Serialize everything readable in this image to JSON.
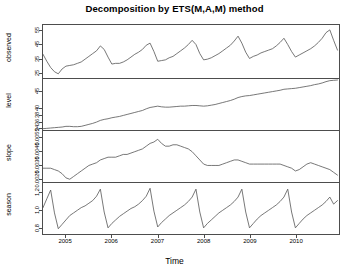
{
  "chart_data": {
    "type": "line",
    "title": "Decomposition by ETS(M,A,M) method",
    "xlabel": "Time",
    "ylabel": "",
    "grid": false,
    "legend": "none",
    "xlim": [
      2004.5,
      2010.95
    ],
    "x_ticks": [
      "2005",
      "2006",
      "2007",
      "2008",
      "2009",
      "2010"
    ],
    "x_tick_values": [
      2005,
      2006,
      2007,
      2008,
      2009,
      2010
    ],
    "x": [
      2004.5,
      2004.583,
      2004.667,
      2004.75,
      2004.833,
      2004.917,
      2005.0,
      2005.083,
      2005.167,
      2005.25,
      2005.333,
      2005.417,
      2005.5,
      2005.583,
      2005.667,
      2005.75,
      2005.833,
      2005.917,
      2006.0,
      2006.083,
      2006.167,
      2006.25,
      2006.333,
      2006.417,
      2006.5,
      2006.583,
      2006.667,
      2006.75,
      2006.833,
      2006.917,
      2007.0,
      2007.083,
      2007.167,
      2007.25,
      2007.333,
      2007.417,
      2007.5,
      2007.583,
      2007.667,
      2007.75,
      2007.833,
      2007.917,
      2008.0,
      2008.083,
      2008.167,
      2008.25,
      2008.333,
      2008.417,
      2008.5,
      2008.583,
      2008.667,
      2008.75,
      2008.833,
      2008.917,
      2009.0,
      2009.083,
      2009.167,
      2009.25,
      2009.333,
      2009.417,
      2009.5,
      2009.583,
      2009.667,
      2009.75,
      2009.833,
      2009.917,
      2010.0,
      2010.083,
      2010.167,
      2010.25,
      2010.333,
      2010.417,
      2010.5,
      2010.583,
      2010.667,
      2010.75,
      2010.833,
      2010.917
    ],
    "panels": [
      {
        "name": "observed",
        "label": "observed",
        "ylim": [
          21,
          59
        ],
        "y_ticks": [
          "25",
          "35",
          "45",
          "55"
        ],
        "y_tick_values": [
          25,
          35,
          45,
          55
        ],
        "values": [
          38.0,
          33.0,
          28.5,
          25.5,
          24.0,
          27.5,
          29.5,
          30.0,
          30.5,
          31.5,
          32.5,
          34.5,
          36.5,
          38.5,
          40.5,
          44.0,
          41.5,
          36.0,
          31.0,
          31.5,
          31.5,
          32.5,
          34.0,
          36.0,
          38.0,
          39.5,
          41.5,
          44.5,
          46.0,
          40.0,
          33.0,
          33.5,
          34.0,
          35.5,
          36.5,
          38.5,
          40.5,
          42.5,
          45.0,
          48.0,
          45.0,
          38.5,
          34.0,
          34.5,
          35.5,
          37.0,
          38.5,
          40.5,
          42.5,
          44.5,
          47.5,
          51.0,
          46.0,
          39.5,
          35.0,
          36.5,
          37.5,
          39.0,
          40.0,
          41.0,
          42.0,
          44.0,
          46.5,
          49.5,
          45.0,
          40.0,
          36.0,
          37.5,
          39.0,
          40.5,
          42.0,
          44.0,
          46.5,
          49.5,
          53.5,
          55.5,
          48.0,
          41.0
        ]
      },
      {
        "name": "level",
        "label": "level",
        "ylim": [
          33.2,
          48.6
        ],
        "y_ticks": [
          "34",
          "36",
          "38",
          "40",
          "45"
        ],
        "y_tick_values": [
          34,
          36,
          38,
          40,
          45
        ],
        "values": [
          33.6,
          33.7,
          33.8,
          33.9,
          34.0,
          34.1,
          34.3,
          34.3,
          34.2,
          34.2,
          34.3,
          34.6,
          34.9,
          35.2,
          35.6,
          36.1,
          36.4,
          36.6,
          36.9,
          37.1,
          37.3,
          37.6,
          37.9,
          38.2,
          38.5,
          38.8,
          39.1,
          39.6,
          40.0,
          40.2,
          40.4,
          40.2,
          40.1,
          40.1,
          40.2,
          40.3,
          40.4,
          40.4,
          40.5,
          40.6,
          40.6,
          40.5,
          40.4,
          40.5,
          40.7,
          40.9,
          41.2,
          41.5,
          41.8,
          42.1,
          42.5,
          43.0,
          43.3,
          43.5,
          43.6,
          43.8,
          44.0,
          44.2,
          44.4,
          44.6,
          44.8,
          45.0,
          45.2,
          45.5,
          45.6,
          45.7,
          45.8,
          46.0,
          46.2,
          46.4,
          46.6,
          46.9,
          47.1,
          47.4,
          47.8,
          48.1,
          48.2,
          48.3
        ]
      },
      {
        "name": "slope",
        "label": "slope",
        "ylim": [
          0.0022,
          0.0059
        ],
        "y_ticks": [
          "0.0025",
          "0.0035",
          "0.0045",
          "0.0055"
        ],
        "y_tick_values": [
          0.0025,
          0.0035,
          0.0045,
          0.0055
        ],
        "values": [
          0.0032,
          0.0032,
          0.0032,
          0.0031,
          0.003,
          0.0028,
          0.0025,
          0.0024,
          0.0026,
          0.0028,
          0.003,
          0.0032,
          0.0034,
          0.0035,
          0.0036,
          0.0038,
          0.0039,
          0.004,
          0.004,
          0.004,
          0.0041,
          0.0042,
          0.0042,
          0.0043,
          0.0044,
          0.0045,
          0.0046,
          0.0048,
          0.005,
          0.0051,
          0.0053,
          0.005,
          0.0048,
          0.0048,
          0.0049,
          0.0049,
          0.0048,
          0.0047,
          0.0046,
          0.0044,
          0.0041,
          0.0038,
          0.0035,
          0.0034,
          0.0034,
          0.0034,
          0.0034,
          0.0035,
          0.0036,
          0.0037,
          0.0038,
          0.0038,
          0.0037,
          0.0036,
          0.0035,
          0.0035,
          0.0035,
          0.0035,
          0.0035,
          0.0035,
          0.0035,
          0.0035,
          0.0035,
          0.0034,
          0.0033,
          0.0032,
          0.003,
          0.0031,
          0.0033,
          0.0035,
          0.0036,
          0.0035,
          0.0034,
          0.0033,
          0.0032,
          0.0031,
          0.0029,
          0.0027
        ]
      },
      {
        "name": "season",
        "label": "season",
        "ylim": [
          0.72,
          1.3
        ],
        "y_ticks": [
          "0.8",
          "1.0",
          "1.2"
        ],
        "y_tick_values": [
          0.8,
          1.0,
          1.2
        ],
        "values": [
          1.02,
          1.12,
          1.22,
          0.96,
          0.78,
          0.83,
          0.88,
          0.93,
          0.96,
          0.99,
          1.02,
          1.04,
          1.07,
          1.1,
          1.15,
          1.23,
          0.97,
          0.79,
          0.84,
          0.88,
          0.92,
          0.95,
          0.98,
          1.01,
          1.03,
          1.06,
          1.1,
          1.15,
          1.24,
          0.98,
          0.8,
          0.85,
          0.89,
          0.93,
          0.96,
          0.99,
          1.02,
          1.05,
          1.09,
          1.14,
          1.23,
          0.97,
          0.79,
          0.84,
          0.88,
          0.92,
          0.96,
          0.99,
          1.02,
          1.05,
          1.09,
          1.14,
          1.23,
          0.97,
          0.79,
          0.84,
          0.89,
          0.93,
          0.96,
          0.99,
          1.02,
          1.05,
          1.09,
          1.14,
          1.23,
          0.97,
          0.79,
          0.84,
          0.89,
          0.93,
          0.96,
          0.99,
          1.02,
          1.05,
          1.09,
          1.14,
          1.06,
          1.1
        ]
      }
    ]
  }
}
